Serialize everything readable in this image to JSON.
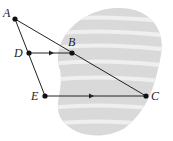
{
  "diagram": {
    "points": [
      {
        "id": "A",
        "label": "A"
      },
      {
        "id": "B",
        "label": "B"
      },
      {
        "id": "C",
        "label": "C"
      },
      {
        "id": "D",
        "label": "D"
      },
      {
        "id": "E",
        "label": "E"
      }
    ],
    "segments": [
      {
        "from": "A",
        "to": "C"
      },
      {
        "from": "A",
        "to": "E"
      },
      {
        "from": "D",
        "to": "B",
        "arrow": true
      },
      {
        "from": "E",
        "to": "C",
        "arrow": true
      }
    ],
    "relations": [
      "DB parallel to EC"
    ],
    "colors": {
      "line": "#222222",
      "region_fill": "#d9d9d9",
      "region_stripe": "#ececec"
    }
  }
}
